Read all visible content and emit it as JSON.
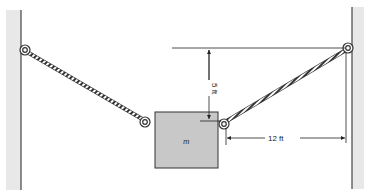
{
  "diagram": {
    "type": "statics-free-body-setup",
    "mass_label": "m",
    "vertical_dimension": "5 ft",
    "horizontal_dimension": "12 ft",
    "elements": [
      "left-wall",
      "right-wall",
      "left-rope",
      "right-rope",
      "hanging-block",
      "eye-bolt-rings",
      "dimension-lines"
    ]
  },
  "colors": {
    "wall_fill": "#e6e6e6",
    "wall_edge": "#444444",
    "block_fill": "#c8c8c8",
    "block_edge": "#333333",
    "rope": "#333333",
    "dimension_line": "#222222"
  }
}
